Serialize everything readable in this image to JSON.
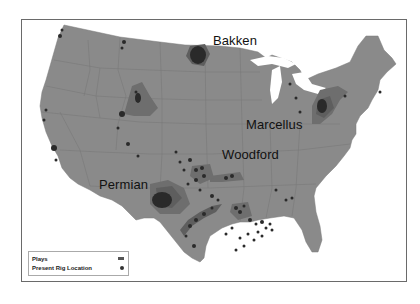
{
  "map": {
    "type": "us-map",
    "colors": {
      "land": "#8a8a8a",
      "state_lines": "#777777",
      "play_region": "#6e6e6e",
      "play_core": "#5e5e5e",
      "rig": "#2a2a2a",
      "water": "#ffffff"
    },
    "labels": [
      {
        "id": "bakken",
        "text": "Bakken"
      },
      {
        "id": "marcellus",
        "text": "Marcellus"
      },
      {
        "id": "woodford",
        "text": "Woodford"
      },
      {
        "id": "permian",
        "text": "Permian"
      }
    ]
  },
  "legend": {
    "items": [
      {
        "label": "Plays",
        "symbol": "rect"
      },
      {
        "label": "Present Rig Location",
        "symbol": "dot"
      }
    ]
  }
}
